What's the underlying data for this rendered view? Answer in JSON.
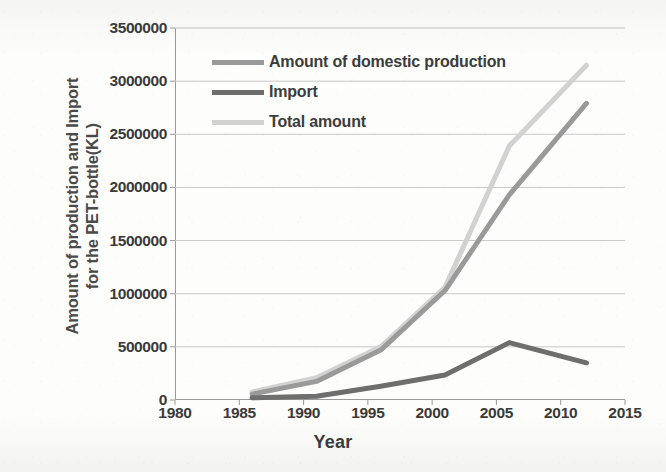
{
  "chart_data": {
    "type": "line",
    "title": "",
    "xlabel": "Year",
    "ylabel": "Amount of production and Import for the PET-bottle(KL)",
    "ylabel_line1": "Amount of production and Import",
    "ylabel_line2": "for the PET-bottle(KL)",
    "xlim": [
      1980,
      2015
    ],
    "ylim": [
      0,
      3500000
    ],
    "xticks": [
      "1980",
      "1985",
      "1990",
      "1995",
      "2000",
      "2005",
      "2010",
      "2015"
    ],
    "xtick_values": [
      1980,
      1985,
      1990,
      1995,
      2000,
      2005,
      2010,
      2015
    ],
    "yticks": [
      "0",
      "500000",
      "1000000",
      "1500000",
      "2000000",
      "2500000",
      "3000000",
      "3500000"
    ],
    "ytick_values": [
      0,
      500000,
      1000000,
      1500000,
      2000000,
      2500000,
      3000000,
      3500000
    ],
    "grid": true,
    "grid_axis": "y",
    "legend_position": "upper-left-inside",
    "x": [
      1986,
      1991,
      1996,
      2001,
      2006,
      2012
    ],
    "series": [
      {
        "name": "Amount of domestic production",
        "color": "#9a9a9a",
        "values": [
          55000,
          175000,
          470000,
          1030000,
          1930000,
          2790000
        ]
      },
      {
        "name": "Import",
        "color": "#6e6e6e",
        "values": [
          20000,
          35000,
          130000,
          235000,
          540000,
          350000
        ]
      },
      {
        "name": "Total amount",
        "color": "#d2d2d2",
        "values": [
          75000,
          210000,
          500000,
          1060000,
          2390000,
          3150000
        ]
      }
    ]
  },
  "legend": {
    "items": [
      {
        "label": "Amount of domestic production",
        "color": "#9a9a9a"
      },
      {
        "label": "Import",
        "color": "#6e6e6e"
      },
      {
        "label": "Total amount",
        "color": "#d2d2d2"
      }
    ]
  },
  "colors": {
    "domestic_production": "#9a9a9a",
    "import": "#6e6e6e",
    "total_amount": "#d2d2d2",
    "axis": "#9a9a9a",
    "grid": "#c8c8c8",
    "text": "#3c3c3c",
    "background": "#fdfdfb"
  }
}
